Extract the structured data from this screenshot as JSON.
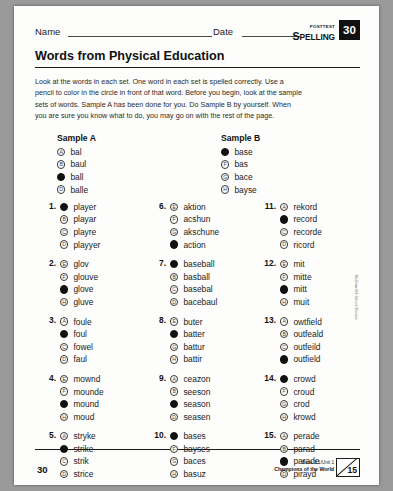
{
  "header": {
    "name_label": "Name",
    "date_label": "Date",
    "posttest_label": "POSTTEST",
    "spelling_label": "SPELLING",
    "lesson_number": "30"
  },
  "title": "Words from Physical Education",
  "instructions": "Look at the words in each set. One word in each set is spelled correctly. Use a pencil to color in the circle in front of that word. Before you begin, look at the sample sets of words. Sample A has been done for you. Do Sample B by yourself. When you are sure you know what to do, you may go on with the rest of the page.",
  "samples": [
    {
      "heading": "Sample A",
      "options": [
        {
          "letter": "A",
          "word": "bal",
          "filled": false
        },
        {
          "letter": "B",
          "word": "baul",
          "filled": false
        },
        {
          "letter": "C",
          "word": "ball",
          "filled": true
        },
        {
          "letter": "D",
          "word": "balle",
          "filled": false
        }
      ]
    },
    {
      "heading": "Sample B",
      "options": [
        {
          "letter": "E",
          "word": "base",
          "filled": true
        },
        {
          "letter": "F",
          "word": "bas",
          "filled": false
        },
        {
          "letter": "G",
          "word": "bace",
          "filled": false
        },
        {
          "letter": "H",
          "word": "bayse",
          "filled": false
        }
      ]
    }
  ],
  "columns": [
    [
      {
        "number": "1.",
        "options": [
          {
            "letter": "A",
            "word": "player",
            "filled": true
          },
          {
            "letter": "B",
            "word": "playar",
            "filled": false
          },
          {
            "letter": "C",
            "word": "playre",
            "filled": false
          },
          {
            "letter": "D",
            "word": "playyer",
            "filled": false
          }
        ]
      },
      {
        "number": "2.",
        "options": [
          {
            "letter": "E",
            "word": "glov",
            "filled": false
          },
          {
            "letter": "F",
            "word": "glouve",
            "filled": false
          },
          {
            "letter": "G",
            "word": "glove",
            "filled": true
          },
          {
            "letter": "H",
            "word": "gluve",
            "filled": false
          }
        ]
      },
      {
        "number": "3.",
        "options": [
          {
            "letter": "A",
            "word": "foule",
            "filled": false
          },
          {
            "letter": "B",
            "word": "foul",
            "filled": true
          },
          {
            "letter": "C",
            "word": "fowel",
            "filled": false
          },
          {
            "letter": "D",
            "word": "faul",
            "filled": false
          }
        ]
      },
      {
        "number": "4.",
        "options": [
          {
            "letter": "E",
            "word": "mownd",
            "filled": false
          },
          {
            "letter": "F",
            "word": "mounde",
            "filled": false
          },
          {
            "letter": "G",
            "word": "mound",
            "filled": true
          },
          {
            "letter": "H",
            "word": "moud",
            "filled": false
          }
        ]
      },
      {
        "number": "5.",
        "options": [
          {
            "letter": "A",
            "word": "stryke",
            "filled": false
          },
          {
            "letter": "B",
            "word": "strike",
            "filled": true
          },
          {
            "letter": "C",
            "word": "strik",
            "filled": false
          },
          {
            "letter": "D",
            "word": "strice",
            "filled": false
          }
        ]
      }
    ],
    [
      {
        "number": "6.",
        "options": [
          {
            "letter": "E",
            "word": "aktion",
            "filled": false
          },
          {
            "letter": "F",
            "word": "acshun",
            "filled": false
          },
          {
            "letter": "G",
            "word": "akschune",
            "filled": false
          },
          {
            "letter": "H",
            "word": "action",
            "filled": true
          }
        ]
      },
      {
        "number": "7.",
        "options": [
          {
            "letter": "A",
            "word": "baseball",
            "filled": true
          },
          {
            "letter": "B",
            "word": "basball",
            "filled": false
          },
          {
            "letter": "C",
            "word": "basebal",
            "filled": false
          },
          {
            "letter": "D",
            "word": "bacebaul",
            "filled": false
          }
        ]
      },
      {
        "number": "8.",
        "options": [
          {
            "letter": "E",
            "word": "buter",
            "filled": false
          },
          {
            "letter": "F",
            "word": "batter",
            "filled": true
          },
          {
            "letter": "G",
            "word": "battur",
            "filled": false
          },
          {
            "letter": "H",
            "word": "battir",
            "filled": false
          }
        ]
      },
      {
        "number": "9.",
        "options": [
          {
            "letter": "A",
            "word": "ceazon",
            "filled": false
          },
          {
            "letter": "B",
            "word": "seeson",
            "filled": false
          },
          {
            "letter": "C",
            "word": "season",
            "filled": true
          },
          {
            "letter": "D",
            "word": "seasen",
            "filled": false
          }
        ]
      },
      {
        "number": "10.",
        "options": [
          {
            "letter": "E",
            "word": "bases",
            "filled": true
          },
          {
            "letter": "F",
            "word": "bayses",
            "filled": false
          },
          {
            "letter": "G",
            "word": "baces",
            "filled": false
          },
          {
            "letter": "H",
            "word": "basuz",
            "filled": false
          }
        ]
      }
    ],
    [
      {
        "number": "11.",
        "options": [
          {
            "letter": "A",
            "word": "rekord",
            "filled": false
          },
          {
            "letter": "B",
            "word": "record",
            "filled": true
          },
          {
            "letter": "C",
            "word": "recorde",
            "filled": false
          },
          {
            "letter": "D",
            "word": "ricord",
            "filled": false
          }
        ]
      },
      {
        "number": "12.",
        "options": [
          {
            "letter": "E",
            "word": "mit",
            "filled": false
          },
          {
            "letter": "F",
            "word": "mitte",
            "filled": false
          },
          {
            "letter": "G",
            "word": "mitt",
            "filled": true
          },
          {
            "letter": "H",
            "word": "muit",
            "filled": false
          }
        ]
      },
      {
        "number": "13.",
        "options": [
          {
            "letter": "A",
            "word": "owtfield",
            "filled": false
          },
          {
            "letter": "B",
            "word": "outfeald",
            "filled": false
          },
          {
            "letter": "C",
            "word": "outfeild",
            "filled": false
          },
          {
            "letter": "D",
            "word": "outfield",
            "filled": true
          }
        ]
      },
      {
        "number": "14.",
        "options": [
          {
            "letter": "E",
            "word": "crowd",
            "filled": true
          },
          {
            "letter": "F",
            "word": "croud",
            "filled": false
          },
          {
            "letter": "G",
            "word": "crod",
            "filled": false
          },
          {
            "letter": "H",
            "word": "krowd",
            "filled": false
          }
        ]
      },
      {
        "number": "15.",
        "options": [
          {
            "letter": "A",
            "word": "perade",
            "filled": false
          },
          {
            "letter": "B",
            "word": "parad",
            "filled": false
          },
          {
            "letter": "C",
            "word": "parade",
            "filled": true
          },
          {
            "letter": "D",
            "word": "pirayd",
            "filled": false
          }
        ]
      }
    ]
  ],
  "footer": {
    "page_number": "30",
    "book_line": "Book 3.1/Unit 1",
    "unit_title": "Champions of the World",
    "score_total": "15"
  },
  "side_credit": "McGraw-Hill School Division"
}
